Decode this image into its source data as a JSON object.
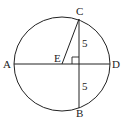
{
  "diagram": {
    "type": "circle-geometry",
    "points": {
      "A": {
        "label": "A"
      },
      "B": {
        "label": "B"
      },
      "C": {
        "label": "C"
      },
      "D": {
        "label": "D"
      },
      "E": {
        "label": "E"
      }
    },
    "segments": [
      "AD",
      "CB",
      "EC"
    ],
    "lengths": {
      "upper": "5",
      "lower": "5"
    },
    "right_angle_marker": true,
    "colors": {
      "stroke": "#222222",
      "background": "#ffffff"
    }
  }
}
